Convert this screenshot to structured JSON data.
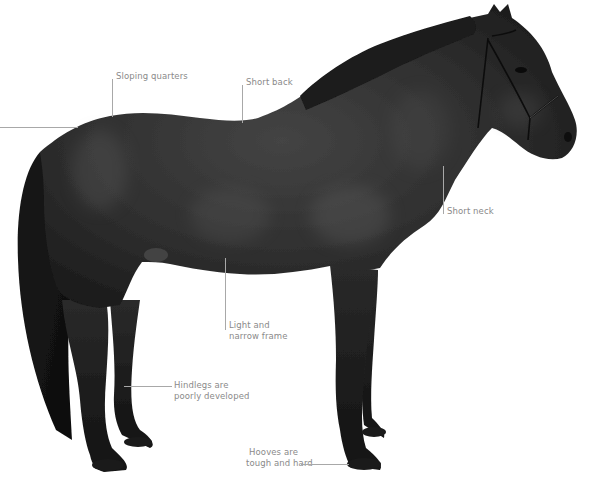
{
  "diagram": {
    "colors": {
      "background": "#ffffff",
      "coat_dark": "#1e1e1e",
      "coat_mid": "#3a3a3a",
      "coat_highlight": "#5a5a5a",
      "label_text": "#8a8a8a",
      "leader_line": "#a8a8a8"
    },
    "annotations": [
      {
        "id": "sloping-quarters",
        "text": "Sloping quarters"
      },
      {
        "id": "short-back",
        "text": "Short back"
      },
      {
        "id": "short-neck",
        "text": "Short neck"
      },
      {
        "id": "light-narrow-frame",
        "line1": "Light and",
        "line2": "narrow frame"
      },
      {
        "id": "hindlegs",
        "line1": "Hindlegs are",
        "line2": "poorly developed"
      },
      {
        "id": "hooves",
        "line1": "Hooves are",
        "line2": "tough and hard"
      }
    ]
  }
}
